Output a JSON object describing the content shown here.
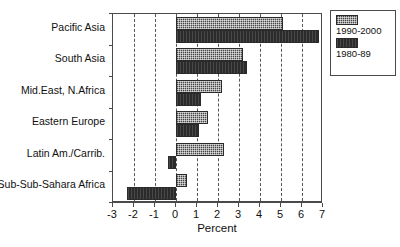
{
  "chart_data": {
    "type": "bar",
    "orientation": "horizontal",
    "title": "",
    "xlabel": "Percent",
    "ylabel": "",
    "xlim": [
      -3,
      7
    ],
    "xticks": [
      -3,
      -2,
      -1,
      0,
      1,
      2,
      3,
      4,
      5,
      6,
      7
    ],
    "xticklabels": [
      "-3",
      "-2",
      "-1",
      "0",
      "1",
      "2",
      "3",
      "4",
      "5",
      "6",
      "7"
    ],
    "grid": true,
    "grid_axis": "x",
    "legend_position": "upper right",
    "categories": [
      "Pacific Asia",
      "South Asia",
      "Mid.East, N.Africa",
      "Eastern Europe",
      "Latin Am./Carrib.",
      "Sub-Sub-Sahara Africa"
    ],
    "series": [
      {
        "name": "1990-2000",
        "color": "#7d7d7d",
        "values": [
          5.1,
          3.2,
          2.2,
          1.5,
          2.3,
          0.5
        ]
      },
      {
        "name": "1980-89",
        "color": "#2b2b2b",
        "values": [
          6.8,
          3.4,
          1.2,
          1.1,
          -0.4,
          -2.35
        ]
      }
    ]
  },
  "legend": {
    "entries": [
      {
        "label": "1990-2000",
        "swatch": "light-hatched-swatch"
      },
      {
        "label": "1980-89",
        "swatch": "dark-solid-swatch"
      }
    ]
  },
  "axis": {
    "x_title": "Percent"
  }
}
